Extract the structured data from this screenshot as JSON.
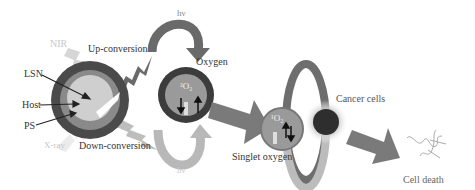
{
  "diagram": {
    "labels": {
      "nir": "NIR",
      "up_conversion": "Up-conversion",
      "down_conversion": "Down-conversion",
      "lsn": "LSN",
      "host": "Host",
      "ps": "PS",
      "xray": "X-ray",
      "hv_top": "hν",
      "hv_bottom": "hν",
      "oxygen": "Oxygen",
      "triplet_symbol": "³O₂",
      "singlet_oxygen": "Singlet oxygen",
      "singlet_symbol": "¹O₂",
      "cancer_cells": "Cancer cells",
      "cell_death": "Cell death"
    },
    "colors": {
      "dark_ring": "#4a4a4a",
      "mid_ring": "#8a8a8a",
      "light_core": "#cfcfcf",
      "arrow_dark": "#6a6a6a",
      "arrow_light": "#b8b8b8",
      "text": "#333333"
    }
  }
}
